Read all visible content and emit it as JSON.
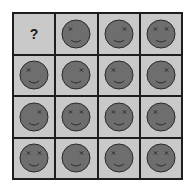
{
  "puzzle": {
    "rows": 4,
    "cols": 4,
    "colors": {
      "cell_background": "#c9c9c9",
      "grid_lines": "#1e1e1e",
      "face_fill": "#6e6e6e",
      "face_outline": "#2a2a2a",
      "feature": "#2a2a2a"
    },
    "cells": [
      {
        "type": "question",
        "label": "?"
      },
      {
        "type": "face",
        "eyes": "left"
      },
      {
        "type": "face",
        "eyes": "right"
      },
      {
        "type": "face",
        "eyes": "both"
      },
      {
        "type": "face",
        "eyes": "left"
      },
      {
        "type": "face",
        "eyes": "right"
      },
      {
        "type": "face",
        "eyes": "left"
      },
      {
        "type": "face",
        "eyes": "right"
      },
      {
        "type": "face",
        "eyes": "right"
      },
      {
        "type": "face",
        "eyes": "both"
      },
      {
        "type": "face",
        "eyes": "both"
      },
      {
        "type": "face",
        "eyes": "left"
      },
      {
        "type": "face",
        "eyes": "both"
      },
      {
        "type": "face",
        "eyes": "right"
      },
      {
        "type": "face",
        "eyes": "left"
      },
      {
        "type": "face",
        "eyes": "both"
      }
    ]
  }
}
